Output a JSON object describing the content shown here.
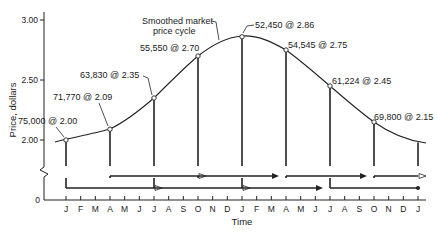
{
  "chart_data": {
    "type": "line",
    "title": "",
    "xlabel": "Time",
    "ylabel": "Price, dollars",
    "ylim": [
      0,
      3.0
    ],
    "y_ticks": [
      "0",
      "2.00",
      "2.50",
      "3.00"
    ],
    "y_axis_break": true,
    "grid": false,
    "legend": null,
    "x_ticks": [
      "J",
      "F",
      "M",
      "A",
      "M",
      "J",
      "J",
      "A",
      "S",
      "O",
      "N",
      "D",
      "J",
      "F",
      "M",
      "A",
      "M",
      "J",
      "J",
      "A",
      "S",
      "O",
      "N",
      "D",
      "J"
    ],
    "curve_label": "Smoothed market price cycle",
    "curve_label_lines": [
      "Smoothed market",
      "price cycle"
    ],
    "points": [
      {
        "month_index": 0,
        "month": "J",
        "quantity": "75,000",
        "price": 2.0,
        "label": "75,000 @ 2.00"
      },
      {
        "month_index": 3,
        "month": "A",
        "quantity": "71,770",
        "price": 2.09,
        "label": "71,770 @ 2.09"
      },
      {
        "month_index": 6,
        "month": "J",
        "quantity": "63,830",
        "price": 2.35,
        "label": "63,830 @ 2.35"
      },
      {
        "month_index": 9,
        "month": "O",
        "quantity": "55,550",
        "price": 2.7,
        "label": "55,550 @ 2.70"
      },
      {
        "month_index": 12,
        "month": "J",
        "quantity": "52,450",
        "price": 2.86,
        "label": "52,450 @ 2.86"
      },
      {
        "month_index": 15,
        "month": "A",
        "quantity": "54,545",
        "price": 2.75,
        "label": "54,545 @ 2.75"
      },
      {
        "month_index": 18,
        "month": "J",
        "quantity": "61,224",
        "price": 2.45,
        "label": "61,224 @ 2.45"
      },
      {
        "month_index": 21,
        "month": "O",
        "quantity": "69,800",
        "price": 2.15,
        "label": "69,800 @ 2.15"
      }
    ],
    "curve_end": {
      "month_index": 24,
      "month": "J",
      "price": 1.98
    },
    "purchase_periods": [
      {
        "start_month_index": 0,
        "end_month_index": 6,
        "row": "lower",
        "arrow": "open"
      },
      {
        "start_month_index": 3,
        "end_month_index": 9,
        "row": "upper",
        "arrow": "open"
      },
      {
        "start_month_index": 6,
        "end_month_index": 12,
        "row": "lower",
        "arrow": "open"
      },
      {
        "start_month_index": 9,
        "end_month_index": 15,
        "row": "upper",
        "arrow": "solid"
      },
      {
        "start_month_index": 12,
        "end_month_index": 18,
        "row": "lower",
        "arrow": "solid"
      },
      {
        "start_month_index": 15,
        "end_month_index": 21,
        "row": "upper",
        "arrow": "solid"
      },
      {
        "start_month_index": 18,
        "end_month_index": 24,
        "row": "lower",
        "arrow": "dot"
      },
      {
        "start_month_index": 21,
        "end_month_index": 27,
        "row": "upper",
        "arrow": "open"
      }
    ]
  },
  "labels": {
    "y_title": "Price, dollars",
    "x_title": "Time",
    "curve_line1": "Smoothed market",
    "curve_line2": "price cycle",
    "y0": "0",
    "y200": "2.00",
    "y250": "2.50",
    "y300": "3.00",
    "p0": "75,000 @ 2.00",
    "p1": "71,770 @ 2.09",
    "p2": "63,830 @ 2.35",
    "p3": "55,550 @ 2.70",
    "p4": "52,450 @ 2.86",
    "p5": "54,545 @ 2.75",
    "p6": "61,224 @ 2.45",
    "p7": "69,800 @ 2.15",
    "months": [
      "J",
      "F",
      "M",
      "A",
      "M",
      "J",
      "J",
      "A",
      "S",
      "O",
      "N",
      "D",
      "J",
      "F",
      "M",
      "A",
      "M",
      "J",
      "J",
      "A",
      "S",
      "O",
      "N",
      "D",
      "J"
    ]
  }
}
